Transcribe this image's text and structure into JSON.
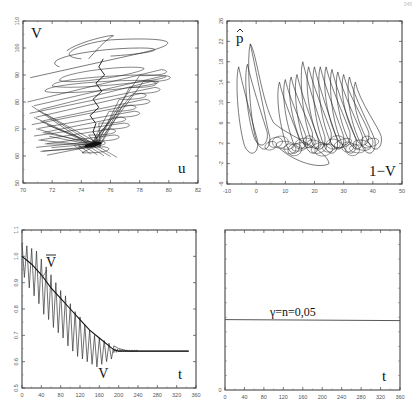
{
  "page": {
    "page_number": "345"
  },
  "chart_data": [
    {
      "id": "top-left",
      "type": "line",
      "subtype": "phase-portrait",
      "title": "",
      "xlabel": "u",
      "ylabel": "V",
      "xlim": [
        70,
        82
      ],
      "ylim": [
        50,
        110
      ],
      "xticks": [
        "70",
        "72",
        "74",
        "76",
        "78",
        "80",
        "82"
      ],
      "yticks": [
        "50",
        "60",
        "70",
        "80",
        "90",
        "100",
        "110"
      ],
      "grid": false,
      "description": "Trajectory spiraling/zig-zagging downward, converging to a dense attractor near u≈74.8, V≈64",
      "series": [
        {
          "name": "trajectory",
          "x": [
            70.5,
            81,
            76,
            72,
            76.5,
            70.3,
            79.5,
            71,
            79,
            70.5,
            78.5,
            70.8,
            77.5,
            71,
            76.5,
            74,
            75,
            74.8
          ],
          "y": [
            89,
            102,
            105,
            95,
            98,
            81,
            85,
            79,
            78,
            76,
            74,
            70,
            71,
            67,
            66,
            64,
            64,
            64
          ]
        }
      ]
    },
    {
      "id": "top-right",
      "type": "line",
      "subtype": "phase-portrait",
      "title": "",
      "xlabel": "1−V",
      "ylabel": "p̂",
      "xlim": [
        -10,
        50
      ],
      "ylim": [
        -6,
        26
      ],
      "xticks": [
        "-10",
        "0",
        "10",
        "20",
        "30",
        "40",
        "50"
      ],
      "yticks": [
        "-6",
        "-2",
        "2",
        "6",
        "10",
        "14",
        "18",
        "22",
        "26"
      ],
      "grid": false,
      "description": "Series of tall narrow loops with peaks ~14–22, base loops near p̂≈0–4, shifting right toward 1−V≈40",
      "series": [
        {
          "name": "loops_peaks",
          "x": [
            -6,
            -2,
            -3,
            8,
            10,
            12,
            14,
            16,
            18,
            20,
            22,
            24,
            26,
            28,
            30,
            32,
            34
          ],
          "y": [
            17,
            21.5,
            17.5,
            14,
            14.5,
            15,
            15.5,
            18,
            17,
            17,
            17,
            17,
            16.5,
            16,
            15.5,
            15,
            14
          ]
        }
      ]
    },
    {
      "id": "bottom-left",
      "type": "line",
      "title": "",
      "xlabel": "t",
      "ylabel": "",
      "xlim": [
        0,
        360
      ],
      "ylim": [
        0.5,
        1.1
      ],
      "xticks": [
        "0",
        "40",
        "80",
        "120",
        "160",
        "200",
        "240",
        "280",
        "320",
        "360"
      ],
      "yticks": [
        "0.5",
        "0.6",
        "0.7",
        "0.8",
        "0.9",
        "1.0",
        "1.1"
      ],
      "grid": false,
      "legend": [
        {
          "label": "V̄",
          "position": "upper-left",
          "note": "smooth mean curve"
        },
        {
          "label": "V",
          "position": "bottom-middle",
          "note": "oscillating curve"
        }
      ],
      "series": [
        {
          "name": "V̄",
          "x": [
            0,
            20,
            40,
            60,
            80,
            100,
            120,
            140,
            160,
            180,
            190,
            200,
            240,
            280,
            320,
            345
          ],
          "y": [
            1.0,
            0.97,
            0.93,
            0.88,
            0.84,
            0.8,
            0.76,
            0.72,
            0.69,
            0.66,
            0.645,
            0.64,
            0.64,
            0.64,
            0.64,
            0.64
          ]
        },
        {
          "name": "V",
          "x": [
            0,
            5,
            10,
            15,
            20,
            25,
            30,
            35,
            40,
            45,
            50,
            55,
            60,
            65,
            70,
            75,
            80,
            85,
            90,
            95,
            100,
            105,
            110,
            115,
            120,
            125,
            130,
            135,
            140,
            145,
            150,
            155,
            160,
            165,
            170,
            175,
            180,
            185,
            190,
            200,
            210,
            220,
            240,
            280,
            320,
            345
          ],
          "y": [
            1.05,
            0.92,
            1.04,
            0.88,
            1.03,
            0.85,
            1.02,
            0.82,
            0.99,
            0.78,
            0.96,
            0.76,
            0.93,
            0.73,
            0.9,
            0.71,
            0.87,
            0.69,
            0.85,
            0.66,
            0.82,
            0.64,
            0.79,
            0.62,
            0.77,
            0.61,
            0.74,
            0.6,
            0.72,
            0.59,
            0.7,
            0.58,
            0.69,
            0.59,
            0.68,
            0.6,
            0.67,
            0.61,
            0.66,
            0.65,
            0.645,
            0.64,
            0.64,
            0.64,
            0.64,
            0.64
          ]
        }
      ]
    },
    {
      "id": "bottom-right",
      "type": "line",
      "title": "",
      "xlabel": "t",
      "ylabel": "",
      "xlim": [
        0,
        360
      ],
      "ylim": [
        0,
        0.11
      ],
      "xticks": [
        "0",
        "40",
        "80",
        "120",
        "160",
        "200",
        "240",
        "280",
        "320",
        "360"
      ],
      "yticks": [
        "0"
      ],
      "grid": false,
      "annotation": "γ=n=0,05",
      "series": [
        {
          "name": "γ=n",
          "x": [
            0,
            360
          ],
          "y": [
            0.05,
            0.05
          ]
        }
      ]
    }
  ]
}
